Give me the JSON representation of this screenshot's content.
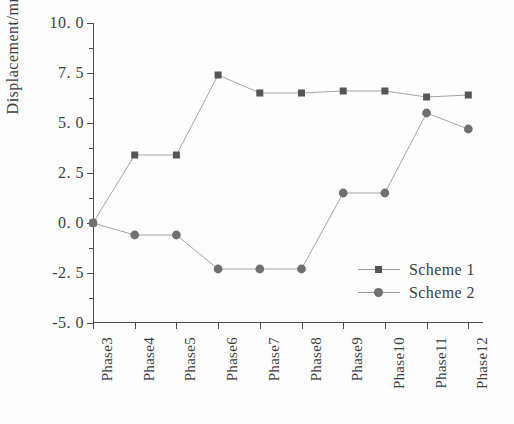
{
  "chart_data": {
    "type": "line",
    "title": "",
    "xlabel": "",
    "ylabel": "Displacement/mm",
    "categories": [
      "Phase3",
      "Phase4",
      "Phase5",
      "Phase6",
      "Phase7",
      "Phase8",
      "Phase9",
      "Phase10",
      "Phase11",
      "Phase12"
    ],
    "ylim": [
      -5.0,
      10.0
    ],
    "ytick_labels": [
      "10. 0",
      "7. 5",
      "5. 0",
      "2. 5",
      "0. 0",
      "-2. 5",
      "-5. 0"
    ],
    "ytick_values": [
      10.0,
      7.5,
      5.0,
      2.5,
      0.0,
      -2.5,
      -5.0
    ],
    "yminor_values": [
      8.75,
      6.25,
      3.75,
      1.25,
      -1.25,
      -3.75
    ],
    "grid": false,
    "legend_position": "lower right inside",
    "series": [
      {
        "name": "Scheme  1",
        "marker": "square",
        "color": "#555555",
        "line_color": "#9a9a9a",
        "values": [
          0.0,
          3.4,
          3.4,
          7.4,
          6.5,
          6.5,
          6.6,
          6.6,
          6.3,
          6.4
        ]
      },
      {
        "name": "Scheme  2",
        "marker": "circle",
        "color": "#707070",
        "line_color": "#9a9a9a",
        "values": [
          0.0,
          -0.6,
          -0.6,
          -2.3,
          -2.3,
          -2.3,
          1.5,
          1.5,
          5.5,
          4.7
        ]
      }
    ]
  },
  "legend": {
    "entries": [
      {
        "label": "Scheme  1",
        "marker": "square"
      },
      {
        "label": "Scheme  2",
        "marker": "circle"
      }
    ]
  },
  "colors": {
    "axis": "#4a4a4a",
    "text": "#3d3d3d",
    "series1": "#555555",
    "series2": "#707070",
    "line": "#9a9a9a",
    "background": "#fdfdfd"
  }
}
